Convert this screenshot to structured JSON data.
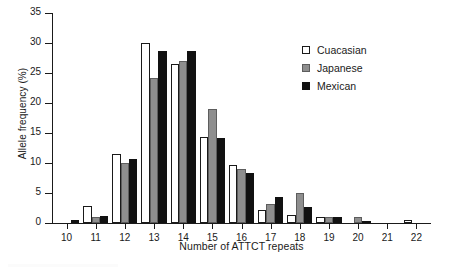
{
  "chart_data": {
    "type": "bar",
    "title": "",
    "subtitle": "",
    "xlabel": "Number of ATTCT repeats",
    "ylabel": "Allele frequency (%)",
    "categories": [
      "10",
      "11",
      "12",
      "13",
      "14",
      "15",
      "16",
      "17",
      "18",
      "19",
      "20",
      "21",
      "22"
    ],
    "series": [
      {
        "name": "Cuacasian",
        "color": "#ffffff",
        "values": [
          0,
          2.8,
          11.5,
          30.0,
          26.5,
          14.3,
          9.7,
          2.1,
          1.3,
          1.0,
          0,
          0,
          0.5
        ]
      },
      {
        "name": "Japanese",
        "color": "#8e8e8e",
        "values": [
          0,
          1.0,
          10.0,
          24.1,
          27.0,
          19.0,
          9.0,
          3.1,
          5.0,
          1.0,
          1.0,
          0,
          0
        ]
      },
      {
        "name": "Mexican",
        "color": "#111111",
        "values": [
          0.5,
          1.1,
          10.7,
          28.6,
          28.6,
          14.1,
          8.3,
          4.3,
          2.7,
          1.0,
          0.4,
          0,
          0
        ]
      }
    ],
    "yticks": [
      0,
      5,
      10,
      15,
      20,
      25,
      30,
      35
    ],
    "ylim": [
      0,
      35
    ],
    "xlim_categories": 13,
    "grid": false,
    "legend_position": "upper-right"
  },
  "legend": {
    "items": [
      {
        "label": "Cuacasian",
        "swatch": "open-square-icon"
      },
      {
        "label": "Japanese",
        "swatch": "grey-square-icon"
      },
      {
        "label": "Mexican",
        "swatch": "black-square-icon"
      }
    ]
  }
}
